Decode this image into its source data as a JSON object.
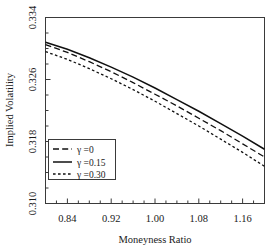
{
  "chart_data": {
    "type": "line",
    "title": "",
    "xlabel": "Moneyness Ratio",
    "ylabel": "Implied Volatility",
    "xlim": [
      0.8,
      1.2
    ],
    "ylim": [
      0.31,
      0.334
    ],
    "xticks": [
      0.84,
      0.92,
      1.0,
      1.08,
      1.16
    ],
    "xtick_labels": [
      "0.84",
      "0.92",
      "1.00",
      "1.08",
      "1.16"
    ],
    "yticks": [
      0.31,
      0.318,
      0.326,
      0.334
    ],
    "ytick_labels": [
      "0.310",
      "0.318",
      "0.326",
      "0.334"
    ],
    "grid": false,
    "legend_position": "lower-left",
    "x": [
      0.8,
      0.84,
      0.88,
      0.92,
      0.96,
      1.0,
      1.04,
      1.08,
      1.12,
      1.16,
      1.2
    ],
    "series": [
      {
        "name": "γ =0",
        "style": "dashed",
        "values": [
          0.3305,
          0.3295,
          0.3283,
          0.327,
          0.3256,
          0.3241,
          0.3226,
          0.321,
          0.3194,
          0.3177,
          0.316
        ]
      },
      {
        "name": "γ =0.15",
        "style": "solid",
        "values": [
          0.3308,
          0.3299,
          0.3288,
          0.3276,
          0.3263,
          0.3249,
          0.3234,
          0.3219,
          0.3203,
          0.3187,
          0.317
        ]
      },
      {
        "name": "γ =0.30",
        "style": "dotted",
        "values": [
          0.3296,
          0.3286,
          0.3274,
          0.3261,
          0.3247,
          0.3232,
          0.3216,
          0.32,
          0.3183,
          0.3166,
          0.3148
        ]
      }
    ]
  },
  "axes": {
    "x_title": "Moneyness Ratio",
    "y_title": "Implied Volatility",
    "x_tick_labels": [
      "0.84",
      "0.92",
      "1.00",
      "1.08",
      "1.16"
    ],
    "y_tick_labels": [
      "0.334",
      "0.326",
      "0.318",
      "0.310"
    ]
  },
  "legend": {
    "entries": [
      {
        "label": "γ =0",
        "style": "dashed"
      },
      {
        "label": "γ =0.15",
        "style": "solid"
      },
      {
        "label": "γ =0.30",
        "style": "dotted"
      }
    ]
  },
  "colors": {
    "line": "#101010",
    "axis": "#3a3a3a",
    "background": "#ffffff",
    "text": "#1a1a1a"
  }
}
